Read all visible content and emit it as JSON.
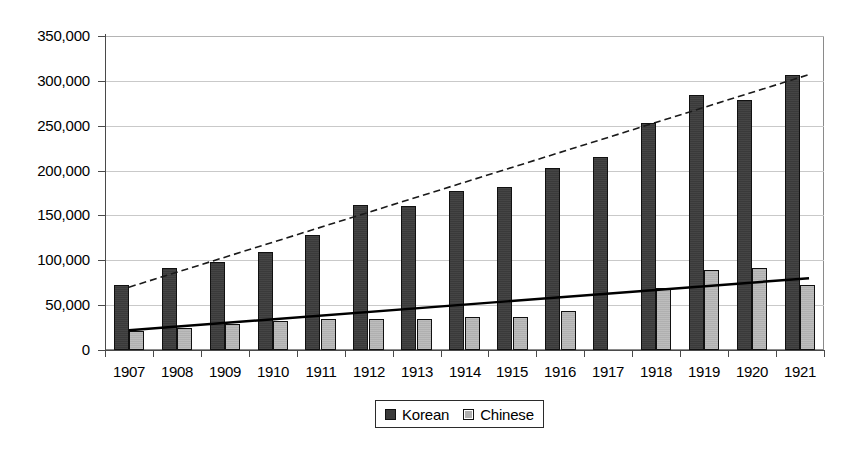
{
  "chart_data": {
    "type": "bar",
    "title": "",
    "subtitle": "",
    "xlabel": "",
    "ylabel": "",
    "ylim": [
      0,
      350000
    ],
    "yticks": [
      0,
      50000,
      100000,
      150000,
      200000,
      250000,
      300000,
      350000
    ],
    "ytick_labels": [
      "0",
      "50,000",
      "100,000",
      "150,000",
      "200,000",
      "250,000",
      "300,000",
      "350,000"
    ],
    "grid": true,
    "legend_position": "bottom-center",
    "categories": [
      "1907",
      "1908",
      "1909",
      "1910",
      "1911",
      "1912",
      "1913",
      "1914",
      "1915",
      "1916",
      "1917",
      "1918",
      "1919",
      "1920",
      "1921"
    ],
    "series": [
      {
        "name": "Korean",
        "color": "#3a3a3a",
        "values": [
          72000,
          91000,
          98000,
          109000,
          128000,
          162000,
          161000,
          177000,
          182000,
          203000,
          215000,
          253000,
          284000,
          279000,
          307000
        ]
      },
      {
        "name": "Chinese",
        "color": "#b0b0b0",
        "values": [
          21000,
          25000,
          29000,
          32000,
          34000,
          35000,
          35000,
          37000,
          37000,
          43000,
          null,
          69000,
          89000,
          91000,
          73000
        ]
      }
    ],
    "trendlines": [
      {
        "name": "Korean trend",
        "style": "dashed",
        "color": "#1a1a1a",
        "start": {
          "x": "1907",
          "y": 70000
        },
        "end": {
          "x": "1921",
          "y": 307000
        }
      },
      {
        "name": "Chinese trend",
        "style": "solid",
        "color": "#000000",
        "start": {
          "x": "1907",
          "y": 22000
        },
        "end": {
          "x": "1921",
          "y": 80000
        }
      }
    ],
    "annotations": []
  },
  "legend": {
    "items": [
      {
        "label": "Korean",
        "swatch": "korean-swatch"
      },
      {
        "label": "Chinese",
        "swatch": "chinese-swatch"
      }
    ]
  }
}
